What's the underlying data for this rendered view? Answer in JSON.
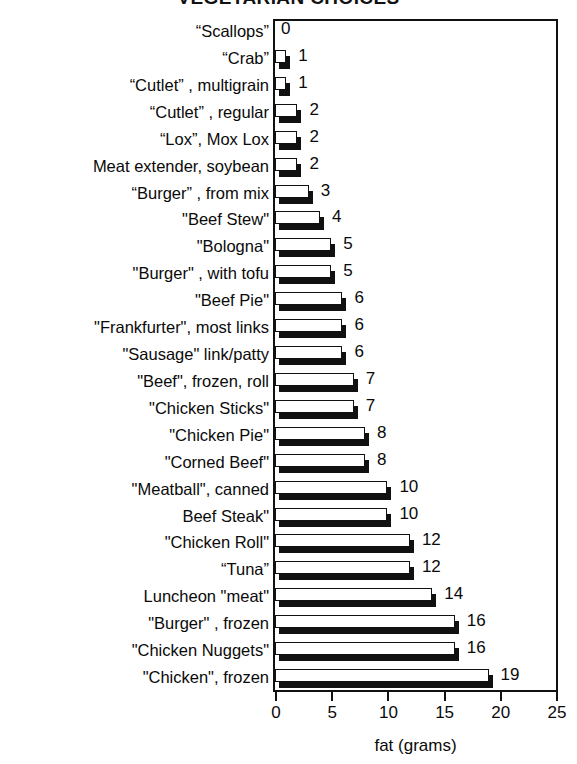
{
  "chart_data": {
    "type": "bar",
    "orientation": "horizontal",
    "title": "VEGETARIAN CHOICES",
    "xlabel": "fat (grams)",
    "ylabel": "",
    "xlim": [
      0,
      25
    ],
    "xticks": [
      0,
      5,
      10,
      15,
      20,
      25
    ],
    "xtick_labels": [
      "0",
      "5",
      "10",
      "15",
      "20",
      "25"
    ],
    "grid": false,
    "legend": null,
    "categories": [
      "“Scallops”",
      "“Crab”",
      "“Cutlet” , multigrain",
      "“Cutlet” , regular",
      "“Lox”, Mox Lox",
      "Meat extender, soybean",
      "“Burger” , from mix",
      "\"Beef Stew\"",
      "\"Bologna\"",
      "\"Burger\" , with tofu",
      "\"Beef Pie\"",
      "\"Frankfurter\", most links",
      "\"Sausage\" link/patty",
      "\"Beef\", frozen, roll",
      "\"Chicken Sticks\"",
      "\"Chicken Pie\"",
      "\"Corned Beef\"",
      "\"Meatball\", canned",
      "Beef Steak\"",
      "\"Chicken Roll\"",
      "“Tuna”",
      "Luncheon \"meat\"",
      "\"Burger\" , frozen",
      "\"Chicken Nuggets\"",
      "\"Chicken\", frozen"
    ],
    "values": [
      0,
      1,
      1,
      2,
      2,
      2,
      3,
      4,
      5,
      5,
      6,
      6,
      6,
      7,
      7,
      8,
      8,
      10,
      10,
      12,
      12,
      14,
      16,
      16,
      19
    ],
    "value_labels": [
      "0",
      "1",
      "1",
      "2",
      "2",
      "2",
      "3",
      "4",
      "5",
      "5",
      "6",
      "6",
      "6",
      "7",
      "7",
      "8",
      "8",
      "10",
      "10",
      "12",
      "12",
      "14",
      "16",
      "16",
      "19"
    ],
    "colors": {
      "bar_face": "#ffffff",
      "bar_edge": "#111111",
      "bar_shadow": "#111111",
      "axis": "#111111",
      "text": "#0a0a0a",
      "background": "#ffffff"
    }
  }
}
